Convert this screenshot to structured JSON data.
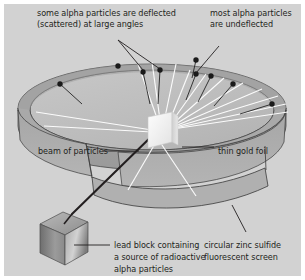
{
  "diagram": {
    "background_color": "#d2d2d2",
    "plate_border_color": "#ffffff",
    "text_color": "#231f20",
    "line_color": "#231f20",
    "ring_top_fill": "#a9a9a9",
    "ring_wall_fill": "#9a9a9a",
    "ring_floor_fill": "#bdbdbd",
    "foil_fill": "#f2f2f2",
    "ray_color": "#ffffff",
    "particle_dot_color": "#1a1a1a",
    "lead_block_light": "#cfcfcf",
    "lead_block_dark": "#6f6f6f"
  },
  "labels": {
    "scattered": {
      "line1": "some alpha particles are deflected",
      "line2": "(scattered) at large angles"
    },
    "undeflected": {
      "line1": "most alpha particles",
      "line2": "are undeflected"
    },
    "beam": "beam of particles",
    "foil": "thin gold foil",
    "lead_block": {
      "line1": "lead block containing",
      "line2": "a source of radioactive",
      "line3": "alpha particles"
    },
    "screen": {
      "line1": "circular zinc sulfide",
      "line2": "fluorescent screen"
    }
  },
  "elements": {
    "detector_ring": "circular zinc sulfide fluorescent screen",
    "gold_foil": "thin gold foil target",
    "lead_block": "lead block alpha particle source",
    "beam_line": "beam of alpha particles",
    "scattered_particles_count": 9,
    "undeflected_ray_count": 12
  }
}
